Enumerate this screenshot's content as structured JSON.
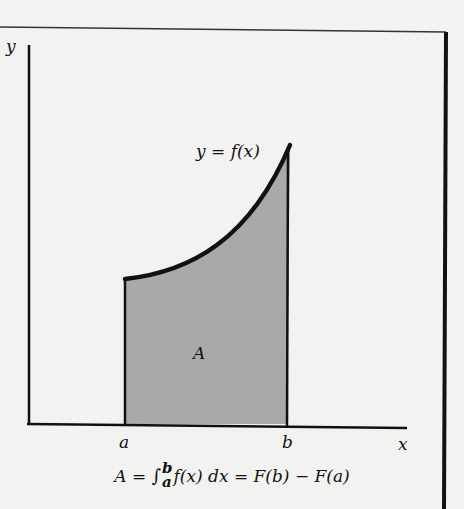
{
  "figure": {
    "y_axis_label": "y",
    "x_axis_label": "x",
    "curve_label": "y = f(x)",
    "area_label": "A",
    "lower_limit_label": "a",
    "upper_limit_label": "b",
    "formula": {
      "lhs": "A",
      "equals1": " = ",
      "integral_sign": "∫",
      "upper": "b",
      "lower": "a",
      "integrand": "f(x) dx",
      "equals2": " = ",
      "rhs": "F(b) − F(a)"
    },
    "colors": {
      "background": "#f2f2f0",
      "ink": "#111111",
      "shaded_area": "#a9a9a9"
    }
  }
}
